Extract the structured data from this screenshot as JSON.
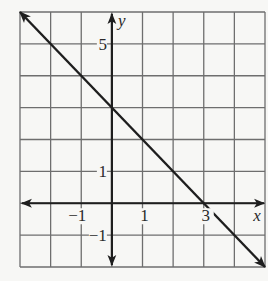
{
  "chart_data": {
    "type": "line",
    "title": "",
    "xlabel": "x",
    "ylabel": "y",
    "xlim": [
      -3,
      5
    ],
    "ylim": [
      -2,
      6
    ],
    "grid": true,
    "grid_step": 1,
    "equation": "y = -x + 3",
    "series": [
      {
        "name": "line",
        "x": [
          -3,
          5
        ],
        "y": [
          6,
          -2
        ],
        "arrows_both_ends": true
      }
    ],
    "x_intercept": 3,
    "y_intercept": 3,
    "x_tick_labels": [
      {
        "value": -1,
        "label": "−1"
      },
      {
        "value": 1,
        "label": "1"
      },
      {
        "value": 3,
        "label": "3"
      }
    ],
    "y_tick_labels": [
      {
        "value": 5,
        "label": "5"
      },
      {
        "value": 1,
        "label": "1"
      },
      {
        "value": -1,
        "label": "−1"
      }
    ]
  },
  "colors": {
    "background": "#f7f7f5",
    "grid": "#6e6e6e",
    "axis": "#1e1e1e",
    "line": "#1e1e1e",
    "text": "#2a2a2a"
  }
}
